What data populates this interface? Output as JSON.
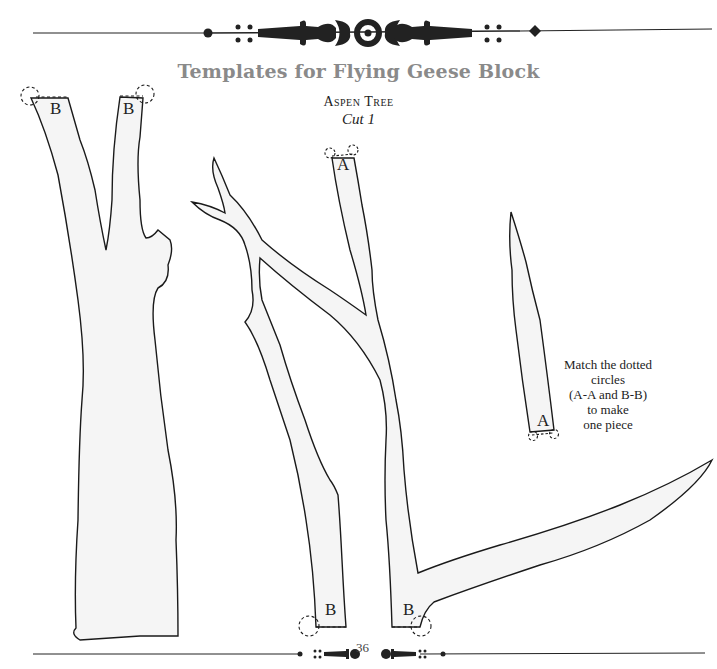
{
  "header": {
    "ornament": "decorative-flourish-divider"
  },
  "title": "Templates for Flying Geese Block",
  "subtitle": "Aspen Tree",
  "cut_instruction": "Cut 1",
  "labels": {
    "trunk_left_b1": "B",
    "trunk_left_b2": "B",
    "branch_top_a": "A",
    "twig_a": "A",
    "branch_bottom_b1": "B",
    "branch_bottom_b2": "B"
  },
  "note": {
    "line1": "Match the dotted",
    "line2": "circles",
    "line3": "(A-A and B-B)",
    "line4": "to make",
    "line5": "one piece"
  },
  "footer": {
    "page_number": "36"
  },
  "colors": {
    "title": "#8a8a8a",
    "shape_fill": "#f4f4f4",
    "outline": "#1a1a1a"
  }
}
